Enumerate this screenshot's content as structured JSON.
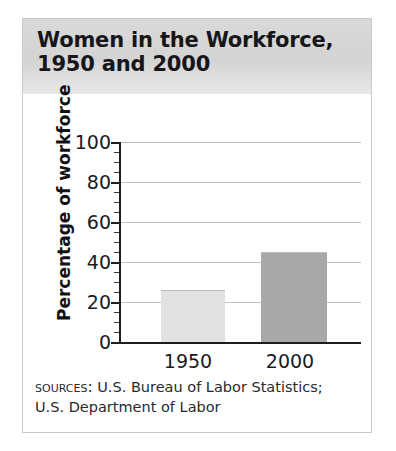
{
  "card": {
    "title": "Women in the Workforce,\n1950 and 2000"
  },
  "sources": {
    "label": "Sources:",
    "line1": "U.S. Bureau of Labor Statistics;",
    "line2": "U.S. Department of Labor"
  },
  "colors": {
    "bar_1950": "#e2e2e2",
    "bar_2000": "#a8a8a8",
    "bar_border": "#bcbcbc",
    "axis": "#1d1d20",
    "gridline": "#bfbfbf",
    "title_band": "#d6d6d6"
  },
  "chart_data": {
    "type": "bar",
    "title": "Women in the Workforce, 1950 and 2000",
    "categories": [
      "1950",
      "2000"
    ],
    "values": [
      26,
      45
    ],
    "xlabel": "",
    "ylabel": "Percentage of workforce",
    "ylim": [
      0,
      100
    ],
    "yticks": [
      0,
      20,
      40,
      60,
      80,
      100
    ],
    "ytick_labels": [
      "0",
      "20",
      "40",
      "60",
      "80",
      "100"
    ],
    "minor_tick_step": 5,
    "grid": "horizontal",
    "legend": "none",
    "bar_colors": [
      "#e2e2e2",
      "#a8a8a8"
    ],
    "source_note": "Sources: U.S. Bureau of Labor Statistics; U.S. Department of Labor"
  }
}
